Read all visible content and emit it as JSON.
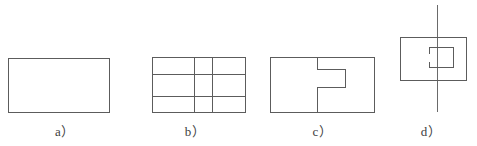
{
  "plate": {
    "width": 477,
    "height": 146,
    "background_color": "#ffffff",
    "line_color": "#5c5c5c",
    "centerline_color": "#6a6a6a",
    "label_color": "#3d3d3d"
  },
  "figures": [
    {
      "id": "a",
      "caption": "a）",
      "description": "plain-rectangle-outline",
      "geometry": {
        "outline_rect": {
          "x": 8,
          "y": 58,
          "width": 102,
          "height": 55
        }
      }
    },
    {
      "id": "b",
      "caption": "b）",
      "description": "rectangle-with-grid-construction-lines",
      "geometry": {
        "outline_rect": {
          "x": 22,
          "y": 57,
          "width": 94,
          "height": 56
        },
        "vertical_lines_x": [
          64,
          82
        ],
        "horizontal_lines_y": [
          74,
          96
        ]
      }
    },
    {
      "id": "c",
      "caption": "c）",
      "description": "rectangle-with-notch-profile-and-divider",
      "geometry": {
        "outline_rect": {
          "x": 10,
          "y": 57,
          "width": 105,
          "height": 56
        },
        "divider_x": 57,
        "notch_path_points": [
          {
            "x": 57,
            "y": 57
          },
          {
            "x": 57,
            "y": 69
          },
          {
            "x": 85,
            "y": 69
          },
          {
            "x": 85,
            "y": 87
          },
          {
            "x": 57,
            "y": 87
          },
          {
            "x": 57,
            "y": 113
          }
        ]
      }
    },
    {
      "id": "d",
      "caption": "d）",
      "description": "rectangle-with-notch-and-vertical-centerline",
      "geometry": {
        "outline_rect": {
          "x": 15,
          "y": 37,
          "width": 67,
          "height": 44
        },
        "centerline": {
          "x": 52,
          "y1": 5,
          "y2": 112
        },
        "notch_path_points": [
          {
            "x": 44,
            "y": 47
          },
          {
            "x": 68,
            "y": 47
          },
          {
            "x": 68,
            "y": 67
          },
          {
            "x": 44,
            "y": 67
          }
        ],
        "notch_stub_upper": {
          "x": 44,
          "y1": 47,
          "y2": 53
        },
        "notch_stub_lower": {
          "x": 44,
          "y1": 61,
          "y2": 67
        }
      }
    }
  ]
}
